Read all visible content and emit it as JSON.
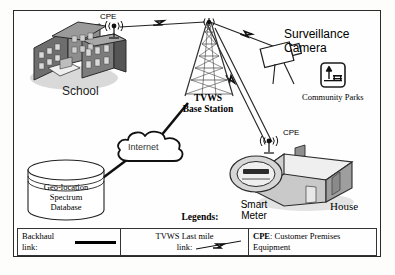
{
  "diagram": {
    "border_color": "#2a2a2a"
  },
  "nodes": {
    "school": {
      "label": "School",
      "cpe_label": "CPE"
    },
    "base_station": {
      "label": "TVWS\nBase Station",
      "line1": "TVWS",
      "line2": "Base Station"
    },
    "camera": {
      "label": "Surveillance\nCamera",
      "line1": "Surveillance",
      "line2": "Camera"
    },
    "parks": {
      "label": "Community Parks",
      "icon": "park-tree-bench-icon"
    },
    "internet": {
      "label": "Internet"
    },
    "database": {
      "line1": "Geo-location",
      "line2": "Spectrum",
      "line3": "Database"
    },
    "house": {
      "label": "House",
      "cpe_label": "CPE"
    },
    "smart_meter": {
      "line1": "Smart",
      "line2": "Meter"
    }
  },
  "legend": {
    "title": "Legends:",
    "items": [
      {
        "label": "Backhaul link:",
        "symbol": "solid-line"
      },
      {
        "label": "TVWS Last mile link:",
        "line1": "TVWS Last mile",
        "line2": "link:",
        "symbol": "lightning-bolt"
      },
      {
        "label": "CPE: Customer Premises Equipment",
        "term": "CPE",
        "definition": ": Customer Premises Equipment"
      }
    ]
  }
}
